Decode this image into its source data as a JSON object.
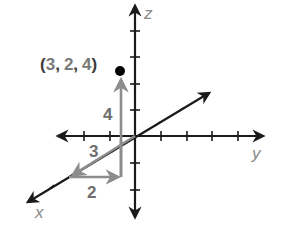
{
  "diagram": {
    "type": "3d-coordinate-axes",
    "axes": {
      "x": {
        "label": "x"
      },
      "y": {
        "label": "y"
      },
      "z": {
        "label": "z"
      }
    },
    "point": {
      "label_open": "(",
      "x": "3",
      "comma1": ",",
      "y": "2",
      "comma2": ",",
      "z": "4",
      "label_close": ")",
      "coordinates": [
        3,
        2,
        4
      ]
    },
    "path_labels": {
      "x_step": "3",
      "y_step": "2",
      "z_step": "4"
    },
    "colors": {
      "axis": "#1a1a1a",
      "path": "#8c8c8c",
      "point": "#000000",
      "label_gray": "#7a7a7a"
    }
  }
}
